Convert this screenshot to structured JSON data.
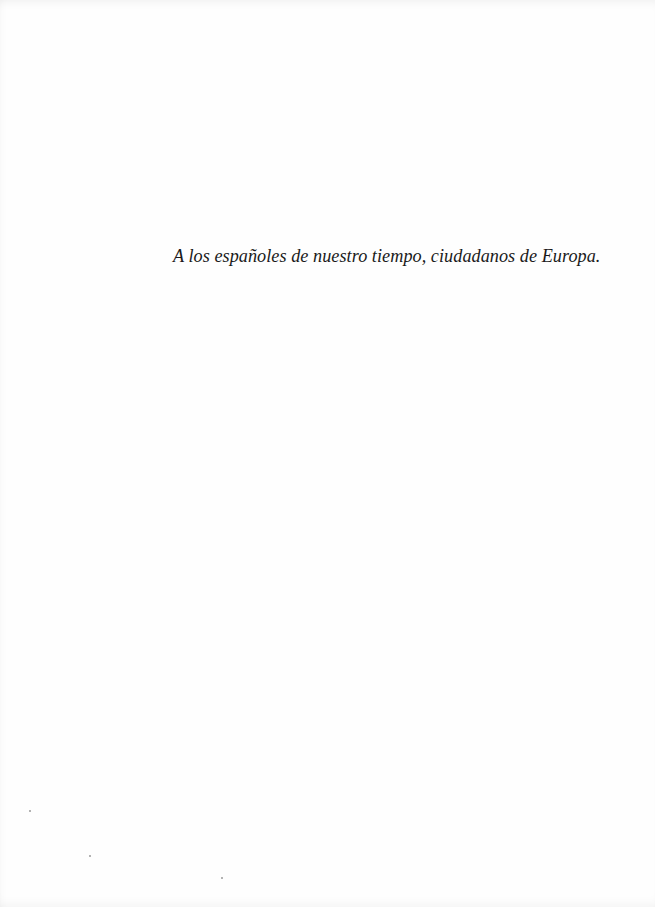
{
  "page": {
    "dedication": "A los españoles de nuestro tiempo, ciudadanos de Europa."
  }
}
